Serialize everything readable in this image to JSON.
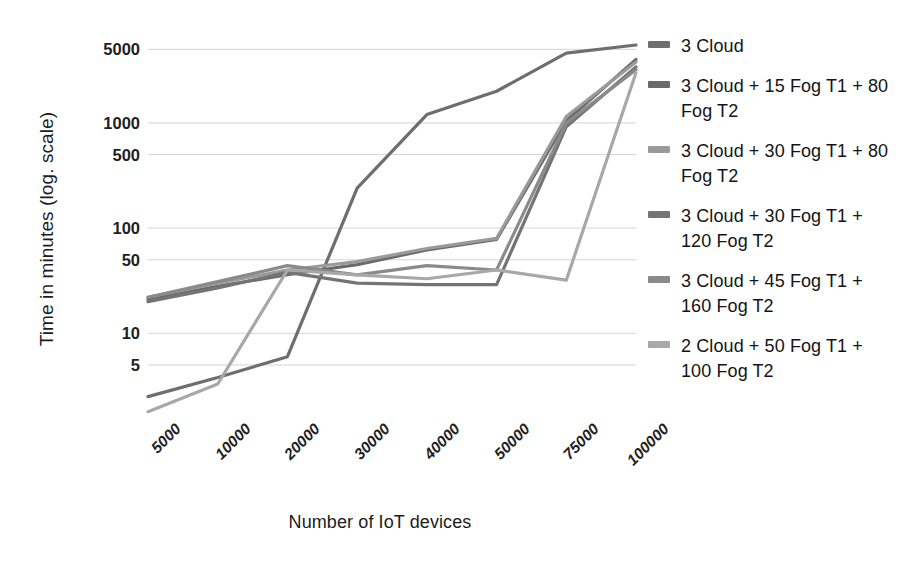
{
  "chart_data": {
    "type": "line",
    "title": "",
    "xlabel": "Number of IoT devices",
    "ylabel": "Time in minutes (log. scale)",
    "yscale": "log",
    "ylim": [
      1.5,
      7000
    ],
    "grid": true,
    "legend_position": "right",
    "categories": [
      "5000",
      "10000",
      "20000",
      "30000",
      "40000",
      "50000",
      "75000",
      "100000"
    ],
    "yticks": [
      "5000",
      "1000",
      "500",
      "100",
      "50",
      "10",
      "5"
    ],
    "ytick_values": [
      5000,
      1000,
      500,
      100,
      50,
      10,
      5
    ],
    "series": [
      {
        "name": "3 Cloud",
        "color": "#6e6e6e",
        "values": [
          2.5,
          3.8,
          6.0,
          240,
          1200,
          2000,
          4600,
          5500
        ]
      },
      {
        "name": "3 Cloud  + 15 Fog T1 + 80 Fog T2",
        "color": "#6a6a6a",
        "values": [
          21,
          28,
          36,
          45,
          62,
          78,
          1050,
          4000
        ]
      },
      {
        "name": "3 Cloud + 30 Fog T1 + 80 Fog T2",
        "color": "#9a9a9a",
        "values": [
          22,
          30,
          40,
          48,
          64,
          80,
          1150,
          3800
        ]
      },
      {
        "name": "3 Cloud + 30 Fog T1 + 120 Fog T2",
        "color": "#747474",
        "values": [
          20,
          27,
          38,
          30,
          29,
          29,
          920,
          3400
        ]
      },
      {
        "name": "3 Cloud + 45 Fog T1 + 160 Fog T2",
        "color": "#8a8a8a",
        "values": [
          22,
          31,
          44,
          36,
          44,
          40,
          1000,
          3200
        ]
      },
      {
        "name": "2 Cloud + 50 Fog T1 + 100 Fog T2",
        "color": "#a8a8a8",
        "values": [
          1.8,
          3.3,
          40,
          36,
          33,
          40,
          32,
          3000
        ]
      }
    ]
  },
  "legend": {
    "items": [
      {
        "label": "3 Cloud"
      },
      {
        "label": "3 Cloud  + 15 Fog T1 + 80 Fog T2"
      },
      {
        "label": "3 Cloud + 30 Fog T1 + 80 Fog T2"
      },
      {
        "label": "3 Cloud + 30 Fog T1 + 120 Fog T2"
      },
      {
        "label": "3 Cloud + 45 Fog T1 + 160 Fog T2"
      },
      {
        "label": "2 Cloud + 50 Fog T1 + 100 Fog T2"
      }
    ]
  },
  "style": {
    "gridline_color": "#d4d4d4",
    "text_color": "#1c1c1c",
    "background": "#ffffff"
  }
}
